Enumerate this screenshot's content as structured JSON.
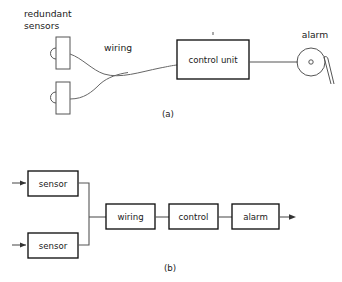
{
  "figure": {
    "background_color": "#ffffff",
    "line_color": "#555555",
    "box_stroke_color": "#111111",
    "text_color": "#1a1a1a"
  },
  "diagram_a": {
    "caption": "(a)",
    "labels": {
      "redundant_line1": "redundant",
      "redundant_line2": "sensors",
      "wiring": "wiring",
      "alarm": "alarm"
    },
    "control_unit_label": "control unit",
    "components": [
      "sensor-top",
      "sensor-bottom",
      "wiring-curve",
      "control-unit",
      "alarm-bell"
    ]
  },
  "diagram_b": {
    "caption": "(b)",
    "blocks": [
      {
        "id": "sensor-top",
        "label": "sensor"
      },
      {
        "id": "sensor-bottom",
        "label": "sensor"
      },
      {
        "id": "wiring",
        "label": "wiring"
      },
      {
        "id": "control",
        "label": "control"
      },
      {
        "id": "alarm",
        "label": "alarm"
      }
    ],
    "structure": "two parallel sensor blocks feeding a series chain of wiring, control and alarm"
  }
}
